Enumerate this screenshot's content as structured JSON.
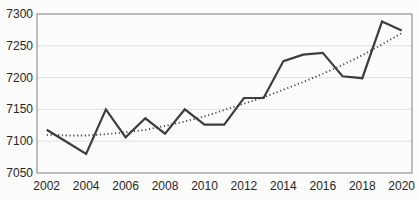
{
  "chart_data": {
    "type": "line",
    "title": "",
    "xlabel": "",
    "ylabel": "",
    "x": [
      2002,
      2003,
      2004,
      2005,
      2006,
      2007,
      2008,
      2009,
      2010,
      2011,
      2012,
      2013,
      2014,
      2015,
      2016,
      2017,
      2018,
      2019,
      2020
    ],
    "series": [
      {
        "name": "value",
        "style": "solid",
        "color": "#3d3d3d",
        "values": [
          7118,
          7099,
          7080,
          7150,
          7106,
          7136,
          7112,
          7150,
          7126,
          7126,
          7168,
          7168,
          7226,
          7236,
          7239,
          7202,
          7199,
          7288,
          7274
        ]
      },
      {
        "name": "trend",
        "style": "dotted",
        "color": "#474747",
        "values": [
          7110,
          7109,
          7109,
          7111,
          7114,
          7118,
          7124,
          7131,
          7139,
          7149,
          7159,
          7169,
          7181,
          7193,
          7206,
          7220,
          7235,
          7252,
          7270
        ]
      }
    ],
    "ylim": [
      7050,
      7300
    ],
    "yticks": [
      7050,
      7100,
      7150,
      7200,
      7250,
      7300
    ],
    "xticks": [
      2002,
      2004,
      2006,
      2008,
      2010,
      2012,
      2014,
      2016,
      2018,
      2020
    ],
    "grid": true,
    "legend": "none"
  },
  "colors": {
    "background": "#fcfcfc",
    "plot_border": "#7f7f7f",
    "gridline": "#e0e0e0",
    "tick_label": "#262626"
  }
}
